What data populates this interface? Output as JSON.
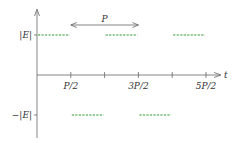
{
  "diagram": {
    "axes": {
      "x_label": "t",
      "y_ticks": [
        {
          "label": "|E|",
          "value": 1
        },
        {
          "label": "−|E|",
          "value": -1
        }
      ],
      "x_ticks": [
        {
          "label": "P/2",
          "value": 0.5
        },
        {
          "label": "",
          "value": 1.0
        },
        {
          "label": "3P/2",
          "value": 1.5
        },
        {
          "label": "",
          "value": 2.0
        },
        {
          "label": "5P/2",
          "value": 2.5
        }
      ]
    },
    "period_annotation": {
      "label": "P",
      "from": 0.5,
      "to": 1.5
    },
    "segments": [
      {
        "from": 0.0,
        "to": 0.5,
        "level": 1
      },
      {
        "from": 1.0,
        "to": 1.5,
        "level": 1
      },
      {
        "from": 2.0,
        "to": 2.5,
        "level": 1
      },
      {
        "from": 0.5,
        "to": 1.0,
        "level": -1
      },
      {
        "from": 1.5,
        "to": 2.0,
        "level": -1
      }
    ],
    "colors": {
      "axis": "#666666",
      "wave": "#2e9a2e",
      "text": "#333333"
    }
  }
}
